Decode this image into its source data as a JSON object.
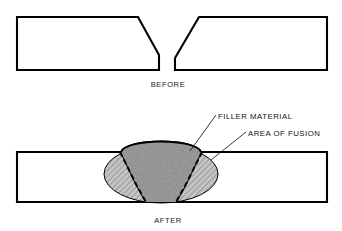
{
  "diagram": {
    "background_color": "#ffffff",
    "line_color": "#000000",
    "hatch_color": "#4d4d4d",
    "fusion_fill_color": "#b8b8b8",
    "filler_fill_color": "#9a9a9a",
    "panels": [
      {
        "id": "before",
        "caption": "BEFORE",
        "caption_x": 168,
        "caption_y": 87,
        "description": "Two steel plates with beveled ends forming a V-groove gap",
        "plates": [
          {
            "name": "left-plate",
            "points": "17,17 138,17 159,55 159,70 17,70"
          },
          {
            "name": "right-plate",
            "points": "199,17 327,17 327,70 175,70 175,58"
          }
        ]
      },
      {
        "id": "after",
        "caption": "AFTER",
        "caption_x": 168,
        "caption_y": 223,
        "description": "Single continuous plate with weld bead, fusion zone and filler material",
        "plates": [
          {
            "name": "joined-plate",
            "points": "17,152 327,152 327,202 17,202"
          }
        ],
        "fusion_zone": {
          "name": "area-of-fusion",
          "center_x": 161,
          "center_y": 174,
          "radius_x": 57,
          "radius_y": 29
        },
        "weld_crown": {
          "name": "filler-material-crown",
          "path": "M 121,152 C 126,138 196,138 201,152"
        },
        "filler_wedge": {
          "name": "filler-material-wedge",
          "path": "M 121,152 C 126,138 196,138 201,152 L 186,184 L 176,202 L 146,202 L 136,184 Z"
        },
        "fusion_boundaries": [
          {
            "name": "left-fusion-boundary",
            "path": "M 120,152 L 136,184 L 146,202"
          },
          {
            "name": "right-fusion-boundary",
            "path": "M 202,152 L 186,184 L 176,202"
          }
        ]
      }
    ],
    "callouts": [
      {
        "id": "filler-material",
        "label": "FILLER MATERIAL",
        "text_x": 218,
        "text_y": 119,
        "leader_path": "M 216,115 L 190,151"
      },
      {
        "id": "area-of-fusion",
        "label": "AREA OF FUSION",
        "text_x": 248,
        "text_y": 136,
        "leader_path": "M 246,132 L 211,160"
      }
    ]
  }
}
